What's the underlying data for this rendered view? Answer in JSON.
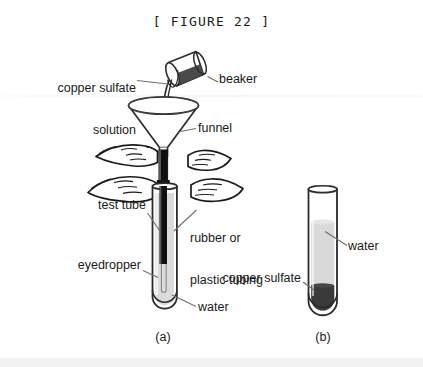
{
  "figure": {
    "title": "[ FIGURE 22 ]",
    "panels": [
      {
        "id": "a",
        "caption": "(a)"
      },
      {
        "id": "b",
        "caption": "(b)"
      }
    ]
  },
  "labels": {
    "copper_sulfate_solution_line1": "copper sulfate",
    "copper_sulfate_solution_line2": "solution",
    "beaker": "beaker",
    "funnel": "funnel",
    "test_tube": "test tube",
    "rubber_tubing_line1": "rubber or",
    "rubber_tubing_line2": "plastic tubing",
    "eyedropper": "eyedropper",
    "water_a": "water",
    "water_b": "water",
    "copper_sulfate_b": "copper sulfate"
  },
  "colors": {
    "ink": "#1a1a1a",
    "outline": "#2b2b2b",
    "liquid_dark": "#4a4a4a",
    "liquid_darker": "#3a3a3a",
    "water_gray": "#d9d9d9",
    "water_gray_light": "#e6e6e6",
    "tube_black": "#101010",
    "leader": "#6e6e6e",
    "footer_band": "#f2f2f2",
    "page": "#ffffff"
  },
  "icons": {
    "beaker": "beaker-icon",
    "funnel": "funnel-icon",
    "test_tube_a": "test-tube-icon",
    "test_tube_b": "test-tube-icon",
    "hand_upper": "hand-icon",
    "hand_lower": "hand-icon",
    "eyedropper": "eyedropper-icon",
    "tubing": "tubing-icon",
    "pour_stream": "pour-stream-icon"
  }
}
